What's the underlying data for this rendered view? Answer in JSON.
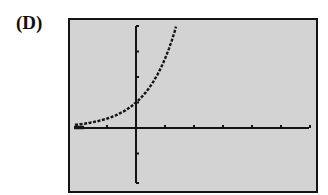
{
  "figure": {
    "label": "(D)"
  },
  "chart_data": {
    "type": "line",
    "title": "",
    "xlabel": "",
    "ylabel": "",
    "function": "y = e^x (exponential growth)",
    "xlim": [
      -2,
      6
    ],
    "ylim": [
      -2,
      4
    ],
    "xticks": [
      -1,
      0,
      1,
      2,
      3,
      4,
      5,
      6
    ],
    "yticks": [
      -1,
      1,
      2,
      3,
      4
    ],
    "grid": false,
    "legend": null,
    "series": [
      {
        "name": "curve",
        "style": "dotted",
        "x": [
          -2,
          -1.5,
          -1,
          -0.5,
          0,
          0.25,
          0.5,
          0.75,
          1,
          1.1,
          1.2,
          1.3,
          1.386
        ],
        "y": [
          0.14,
          0.22,
          0.37,
          0.61,
          1.0,
          1.28,
          1.65,
          2.12,
          2.72,
          3.0,
          3.32,
          3.67,
          4.0
        ]
      }
    ]
  },
  "colors": {
    "screen_background": "#d3d3d3",
    "axis": "#141414",
    "curve": "#141414",
    "frame": "#141414"
  }
}
